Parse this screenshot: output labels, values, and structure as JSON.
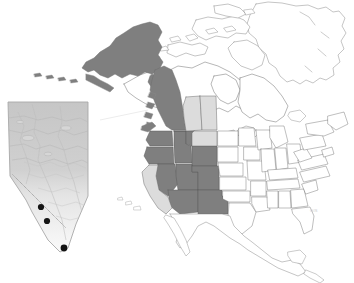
{
  "figure": {
    "type": "distribution-map",
    "region": "North America",
    "attribution_text": "GIS",
    "background_color": "#ffffff"
  },
  "legend_colors": {
    "highlight_dark": "#7f7f7f",
    "highlight_light": "#d4d4d4",
    "unshaded": "#ffffff",
    "outline": "#6b6b6b",
    "coast_outline": "#8a8a8a",
    "point_marker": "#151515",
    "inset_border": "#b4b4b4",
    "inset_fill_upper": "#c8c8c8",
    "inset_fill_lower": "#f2f2f2"
  },
  "main_map": {
    "name": "north-america-base-map",
    "shaded_dark_regions": [
      "Alaska",
      "British Columbia",
      "Yukon (southern)",
      "Washington",
      "Oregon",
      "Idaho",
      "Nevada",
      "Utah",
      "Arizona",
      "New Mexico",
      "Colorado",
      "Wyoming",
      "Montana (western)"
    ],
    "shaded_light_regions": [
      "Alberta",
      "Saskatchewan",
      "Montana (eastern)",
      "California"
    ],
    "unshaded_regions": [
      "Northwest Territories",
      "Nunavut",
      "Manitoba",
      "Ontario",
      "Quebec",
      "Greenland",
      "Eastern United States",
      "Mexico"
    ]
  },
  "inset_map": {
    "name": "alberta-inset-map",
    "region_label": "Alberta",
    "point_count": 3,
    "points": [
      {
        "label": "site-1",
        "x": 41,
        "y": 207
      },
      {
        "label": "site-2",
        "x": 47,
        "y": 221
      },
      {
        "label": "site-3",
        "x": 64,
        "y": 248
      }
    ]
  }
}
